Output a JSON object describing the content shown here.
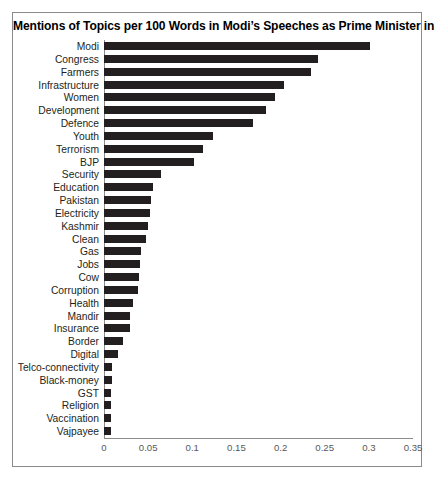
{
  "chart": {
    "title": "Mentions of Topics per 100 Words in Modi’s Speeches as Prime Minister in 2019",
    "axis_color": "#8a8a8a",
    "bar_color": "#231f20",
    "tick_color": "#58595b",
    "label_color": "#231f20"
  },
  "chart_data": {
    "type": "bar",
    "orientation": "horizontal",
    "title": "Mentions of Topics per 100 Words in Modi’s Speeches as Prime Minister in 2019",
    "xlabel": "",
    "ylabel": "",
    "xlim": [
      0,
      0.35
    ],
    "grid": false,
    "legend": false,
    "xticks": [
      "0",
      "0.05",
      "0.1",
      "0.15",
      "0.2",
      "0.25",
      "0.3",
      "0.35"
    ],
    "xtick_values": [
      0,
      0.05,
      0.1,
      0.15,
      0.2,
      0.25,
      0.3,
      0.35
    ],
    "categories": [
      "Modi",
      "Congress",
      "Farmers",
      "Infrastructure",
      "Women",
      "Development",
      "Defence",
      "Youth",
      "Terrorism",
      "BJP",
      "Security",
      "Education",
      "Pakistan",
      "Electricity",
      "Kashmir",
      "Clean",
      "Gas",
      "Jobs",
      "Cow",
      "Corruption",
      "Health",
      "Mandir",
      "Insurance",
      "Border",
      "Digital",
      "Telco-connectivity",
      "Black-money",
      "GST",
      "Religion",
      "Vaccination",
      "Vajpayee"
    ],
    "values": [
      0.301,
      0.242,
      0.234,
      0.204,
      0.194,
      0.184,
      0.169,
      0.124,
      0.112,
      0.102,
      0.064,
      0.056,
      0.053,
      0.052,
      0.05,
      0.048,
      0.042,
      0.041,
      0.04,
      0.038,
      0.033,
      0.03,
      0.029,
      0.022,
      0.016,
      0.009,
      0.009,
      0.008,
      0.008,
      0.008,
      0.008
    ]
  }
}
